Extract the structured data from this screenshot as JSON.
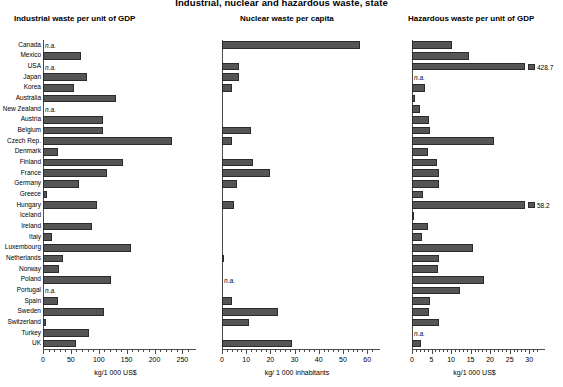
{
  "title": "Industrial, nuclear and hazardous waste, state",
  "countries": [
    "Canada",
    "Mexico",
    "USA",
    "Japan",
    "Korea",
    "Australia",
    "New Zealand",
    "Austria",
    "Belgium",
    "Czech Rep.",
    "Denmark",
    "Finland",
    "France",
    "Germany",
    "Greece",
    "Hungary",
    "Iceland",
    "Ireland",
    "Italy",
    "Luxembourg",
    "Netherlands",
    "Norway",
    "Poland",
    "Portugal",
    "Spain",
    "Sweden",
    "Switzerland",
    "Turkey",
    "UK"
  ],
  "na_text": "n.a.",
  "panels": [
    {
      "title": "Industrial waste per unit of GDP",
      "xlabel": "kg/1 000 US$",
      "xmin": 0,
      "xmax": 260,
      "ticks": [
        0,
        50,
        100,
        150,
        200,
        250
      ],
      "minor_step": 10
    },
    {
      "title": "Nuclear waste per capita",
      "xlabel": "kg/ 1 000 inhabitants",
      "xmin": 0,
      "xmax": 62,
      "ticks": [
        0,
        10,
        20,
        30,
        40,
        50,
        60
      ],
      "minor_step": 2
    },
    {
      "title": "Hazardous waste per unit of GDP",
      "xlabel": "kg/1 000 US$",
      "xmin": 0,
      "xmax": 32,
      "ticks": [
        0,
        5,
        10,
        15,
        20,
        25,
        30
      ],
      "minor_step": 1
    }
  ],
  "chart_data": {
    "type": "bar",
    "title": "Industrial, nuclear and hazardous waste, state",
    "orientation": "horizontal",
    "grid": false,
    "legend": "none",
    "categories": [
      "Canada",
      "Mexico",
      "USA",
      "Japan",
      "Korea",
      "Australia",
      "New Zealand",
      "Austria",
      "Belgium",
      "Czech Rep.",
      "Denmark",
      "Finland",
      "France",
      "Germany",
      "Greece",
      "Hungary",
      "Iceland",
      "Ireland",
      "Italy",
      "Luxembourg",
      "Netherlands",
      "Norway",
      "Poland",
      "Portugal",
      "Spain",
      "Sweden",
      "Switzerland",
      "Turkey",
      "UK"
    ],
    "series": [
      {
        "name": "Industrial waste per unit of GDP",
        "xlabel": "kg/1 000 US$",
        "ylabel": "",
        "xlim": [
          0,
          260
        ],
        "xticks": [
          0,
          50,
          100,
          150,
          200,
          250
        ],
        "values": [
          null,
          68,
          null,
          78,
          55,
          130,
          null,
          107,
          107,
          232,
          27,
          143,
          115,
          65,
          7,
          96,
          0,
          88,
          16,
          157,
          35,
          29,
          122,
          null,
          26,
          110,
          6,
          83,
          60
        ],
        "labels": {
          "Canada": "n.a.",
          "USA": "n.a.",
          "New Zealand": "n.a.",
          "Portugal": "n.a."
        }
      },
      {
        "name": "Nuclear waste per capita",
        "xlabel": "kg/ 1 000 inhabitants",
        "ylabel": "",
        "xlim": [
          0,
          62
        ],
        "xticks": [
          0,
          10,
          20,
          30,
          40,
          50,
          60
        ],
        "values": [
          57,
          0,
          7,
          7,
          4,
          0,
          0,
          0,
          12,
          4,
          0,
          13,
          20,
          6,
          0,
          5,
          0,
          0,
          0,
          0,
          0.7,
          0,
          null,
          0,
          4,
          23,
          11,
          0,
          29
        ],
        "labels": {
          "Poland": "n.a."
        }
      },
      {
        "name": "Hazardous waste per unit of GDP",
        "xlabel": "kg/1 000 US$",
        "ylabel": "",
        "xlim": [
          0,
          32
        ],
        "xticks": [
          0,
          5,
          10,
          15,
          20,
          25,
          30
        ],
        "values": [
          10.3,
          14.5,
          428.7,
          null,
          3.2,
          0.8,
          2.0,
          4.3,
          4.5,
          21.0,
          4.0,
          6.5,
          6.8,
          7.0,
          2.8,
          58.2,
          0.5,
          4.2,
          2.5,
          15.5,
          6.8,
          6.6,
          18.5,
          12.3,
          4.6,
          4.4,
          6.8,
          null,
          2.3
        ],
        "labels": {
          "USA": "n.a.",
          "Japan": "n.a.",
          "Turkey": "n.a."
        },
        "value_labels": {
          "USA": "428.7",
          "Hungary": "58.2"
        },
        "broken_bars": [
          "USA",
          "Hungary"
        ]
      }
    ]
  }
}
